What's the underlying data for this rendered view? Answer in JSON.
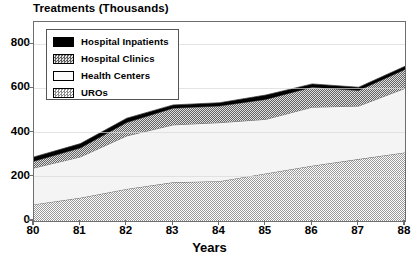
{
  "chart_data": {
    "type": "area",
    "title": "Treatments (Thousands)",
    "subtitle": "",
    "xlabel": "Years",
    "ylabel": "Treatments (Thousands)",
    "stacked": true,
    "grid": false,
    "legend_position": "top-left",
    "categories": [
      "80",
      "81",
      "82",
      "83",
      "84",
      "85",
      "86",
      "87",
      "88"
    ],
    "x": [
      80,
      81,
      82,
      83,
      84,
      85,
      86,
      87,
      88
    ],
    "xlim": [
      80,
      88
    ],
    "ylim": [
      0,
      900
    ],
    "yticks": [
      0,
      200,
      400,
      600,
      800
    ],
    "ytick_labels": [
      "0",
      "200",
      "400",
      "600",
      "800"
    ],
    "xtick_labels": [
      "80",
      "81",
      "82",
      "83",
      "84",
      "85",
      "86",
      "87",
      "88"
    ],
    "series": [
      {
        "name": "UROs",
        "fill": "light-dither",
        "color": "#c9c9c9",
        "values": [
          75,
          105,
          145,
          175,
          180,
          215,
          250,
          280,
          310
        ]
      },
      {
        "name": "Health Centers",
        "fill": "solid-near-white",
        "color": "#f2f2f2",
        "values": [
          165,
          185,
          240,
          260,
          265,
          245,
          265,
          240,
          290
        ]
      },
      {
        "name": "Hospital Clinics",
        "fill": "dark-dither",
        "color": "#7a7a7a",
        "values": [
          30,
          40,
          60,
          75,
          75,
          90,
          90,
          70,
          85
        ]
      },
      {
        "name": "Hospital Inpatients",
        "fill": "solid-black",
        "color": "#000000",
        "values": [
          20,
          20,
          20,
          15,
          15,
          20,
          15,
          15,
          15
        ]
      }
    ],
    "cumulative_tops": {
      "UROs": [
        75,
        105,
        145,
        175,
        180,
        215,
        250,
        280,
        310
      ],
      "Health Centers": [
        240,
        290,
        385,
        435,
        445,
        460,
        515,
        520,
        600
      ],
      "Hospital Clinics": [
        270,
        330,
        445,
        510,
        520,
        550,
        605,
        590,
        685
      ],
      "Hospital Inpatients": [
        290,
        350,
        465,
        525,
        535,
        570,
        620,
        605,
        700
      ]
    },
    "totals": [
      290,
      350,
      465,
      525,
      535,
      570,
      620,
      605,
      700
    ]
  },
  "legend": {
    "items": [
      {
        "label": "Hospital Inpatients",
        "swatch": "solid-black"
      },
      {
        "label": "Hospital Clinics",
        "swatch": "dark-dither"
      },
      {
        "label": "Health Centers",
        "swatch": "solid-near-white"
      },
      {
        "label": "UROs",
        "swatch": "light-dither"
      }
    ]
  },
  "axis": {
    "y_labels": [
      "800",
      "600",
      "400",
      "200",
      "0"
    ],
    "x_labels": [
      "80",
      "81",
      "82",
      "83",
      "84",
      "85",
      "86",
      "87",
      "88"
    ],
    "x_title": "Years"
  },
  "colors": {
    "frame": "#6e6e6e",
    "black": "#000000",
    "dark_gray": "#7a7a7a",
    "light_gray": "#c9c9c9",
    "near_white": "#f2f2f2",
    "background": "#ffffff"
  }
}
